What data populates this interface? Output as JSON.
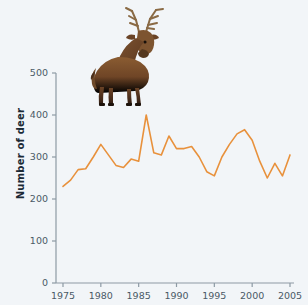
{
  "chart_data": {
    "type": "line",
    "title": "",
    "xlabel": "",
    "ylabel": "Number of deer",
    "xlim": [
      1975,
      2005
    ],
    "ylim": [
      0,
      500
    ],
    "grid": false,
    "legend": null,
    "series_color": "#E8913C",
    "background_color": "#f2f5f8",
    "xticks": [
      1975,
      1980,
      1985,
      1990,
      1995,
      2000,
      2005
    ],
    "yticks": [
      0,
      100,
      200,
      300,
      400,
      500
    ],
    "xtick_labels": [
      "1975",
      "1980",
      "1985",
      "1990",
      "1995",
      "2000",
      "2005"
    ],
    "ytick_labels": [
      "0",
      "100",
      "200",
      "300",
      "400",
      "500"
    ],
    "x": [
      1975,
      1976,
      1977,
      1978,
      1979,
      1980,
      1981,
      1982,
      1983,
      1984,
      1985,
      1986,
      1987,
      1988,
      1989,
      1990,
      1991,
      1992,
      1993,
      1994,
      1995,
      1996,
      1997,
      1998,
      1999,
      2000,
      2001,
      2002,
      2003,
      2004,
      2005
    ],
    "values": [
      230,
      245,
      270,
      272,
      300,
      330,
      305,
      280,
      275,
      295,
      290,
      400,
      310,
      305,
      350,
      320,
      320,
      325,
      300,
      265,
      255,
      300,
      330,
      355,
      365,
      340,
      290,
      250,
      285,
      255,
      305
    ],
    "annotations": [
      {
        "name": "red-deer-photograph",
        "description": "Photograph of a red deer stag with antlers",
        "position": "top-center"
      }
    ]
  },
  "figure": {
    "axis_title": "Number of deer",
    "deer_image_alt": "Red deer stag"
  }
}
